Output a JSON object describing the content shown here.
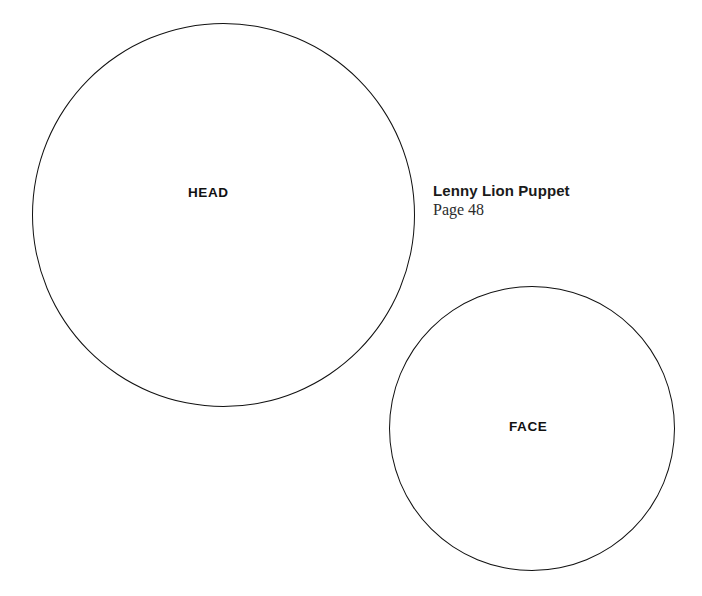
{
  "canvas": {
    "background_color": "#ffffff",
    "stroke_color": "#111111"
  },
  "caption": {
    "title": "Lenny Lion Puppet",
    "page_label": "Page 48"
  },
  "pieces": [
    {
      "id": "head",
      "label": "HEAD",
      "shape": "circle"
    },
    {
      "id": "face",
      "label": "FACE",
      "shape": "circle"
    }
  ]
}
